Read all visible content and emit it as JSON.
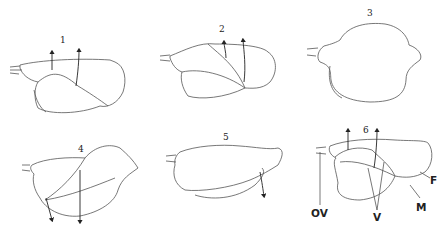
{
  "figure": {
    "panels": [
      {
        "id": "panel-1",
        "label": "1"
      },
      {
        "id": "panel-2",
        "label": "2"
      },
      {
        "id": "panel-3",
        "label": "3"
      },
      {
        "id": "panel-4",
        "label": "4"
      },
      {
        "id": "panel-5",
        "label": "5"
      },
      {
        "id": "panel-6",
        "label": "6"
      }
    ],
    "annotations": {
      "ov": "OV",
      "v": "V",
      "m": "M",
      "f": "F"
    },
    "colors": {
      "line": "#555555",
      "text": "#222222",
      "background": "#ffffff"
    }
  }
}
